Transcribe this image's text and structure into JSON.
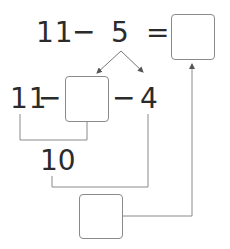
{
  "equation": {
    "minuend": "11",
    "minus": "−",
    "subtrahend": "5",
    "equals": "=",
    "answer_box_value": ""
  },
  "decomposition": {
    "minuend": "11",
    "minus_1": "−",
    "part_box_value": "",
    "minus_2": "−",
    "part_2": "4"
  },
  "intermediate": {
    "value": "10"
  },
  "final_box": {
    "value": ""
  },
  "colors": {
    "text": "#2b2b2b",
    "lines": "#8a8a8a",
    "box_border": "#8a8a8a"
  }
}
